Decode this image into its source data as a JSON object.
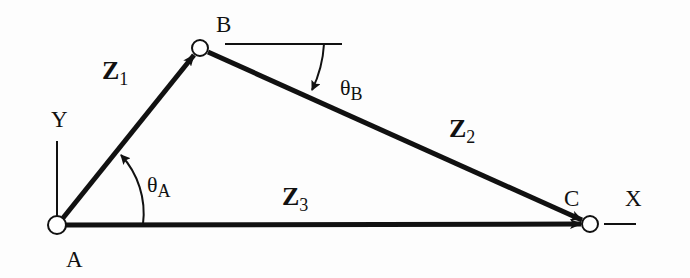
{
  "diagram": {
    "type": "vector-loop",
    "points": {
      "A": {
        "label": "A",
        "x": 57,
        "y": 225
      },
      "B": {
        "label": "B",
        "x": 200,
        "y": 48
      },
      "C": {
        "label": "C",
        "x": 590,
        "y": 224
      }
    },
    "axes": {
      "x_label": "X",
      "y_label": "Y"
    },
    "vectors": [
      {
        "name": "Z",
        "sub": "1",
        "from": "A",
        "to": "B"
      },
      {
        "name": "Z",
        "sub": "2",
        "from": "B",
        "to": "C"
      },
      {
        "name": "Z",
        "sub": "3",
        "from": "A",
        "to": "C"
      }
    ],
    "angles": [
      {
        "symbol": "θ",
        "sub": "A",
        "at": "A"
      },
      {
        "symbol": "θ",
        "sub": "B",
        "at": "B"
      }
    ],
    "colors": {
      "stroke": "#111111",
      "background": "#fdfdfd"
    }
  }
}
